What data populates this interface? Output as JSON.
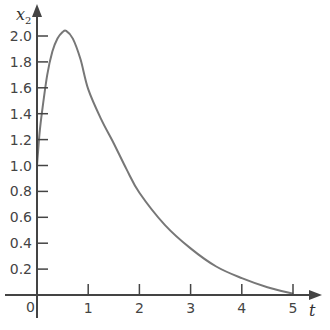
{
  "chart_data": {
    "type": "line",
    "title": "",
    "xlabel": "t",
    "ylabel": "x2",
    "ylabel_main": "x",
    "ylabel_sub": "2",
    "xlim": [
      0,
      5.4
    ],
    "ylim": [
      0,
      2.2
    ],
    "grid": false,
    "legend": null,
    "x_ticks": [
      1,
      2,
      3,
      4,
      5
    ],
    "x_tick_labels": [
      "1",
      "2",
      "3",
      "4",
      "5"
    ],
    "origin_label": "0",
    "y_ticks": [
      0.2,
      0.4,
      0.6,
      0.8,
      1.0,
      1.2,
      1.4,
      1.6,
      1.8,
      2.0
    ],
    "y_tick_labels": [
      "0.2",
      "0.4",
      "0.6",
      "0.8",
      "1.0",
      "1.2",
      "1.4",
      "1.6",
      "1.8",
      "2.0"
    ],
    "series": [
      {
        "name": "x2(t)",
        "color": "#777777",
        "x": [
          0,
          0.05,
          0.1,
          0.2,
          0.3,
          0.4,
          0.5,
          0.57,
          0.7,
          0.85,
          1.0,
          1.25,
          1.5,
          1.75,
          2.0,
          2.5,
          3.0,
          3.5,
          4.0,
          4.5,
          5.0
        ],
        "y": [
          1.0,
          1.25,
          1.42,
          1.7,
          1.88,
          1.98,
          2.03,
          2.04,
          1.98,
          1.82,
          1.59,
          1.36,
          1.17,
          0.97,
          0.79,
          0.54,
          0.36,
          0.22,
          0.13,
          0.06,
          0.01
        ]
      }
    ]
  },
  "colors": {
    "axis": "#444444",
    "curve": "#777777",
    "background": "#ffffff"
  }
}
